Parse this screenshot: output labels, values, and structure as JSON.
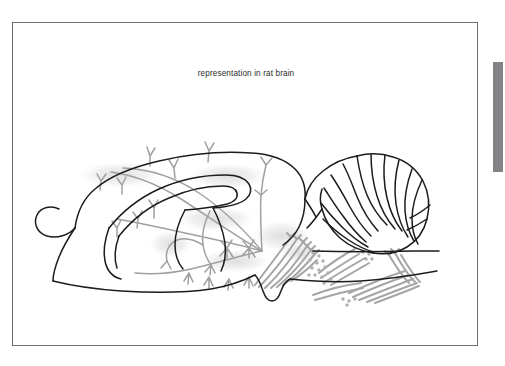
{
  "viewer": {
    "background_color": "#ffffff"
  },
  "figure": {
    "caption": "representation in rat brain",
    "frame": {
      "border_color": "#6d6f72",
      "background_color": "#ffffff",
      "left": 12,
      "top": 22,
      "width": 466,
      "height": 324
    },
    "diagram": {
      "type": "anatomical-line-drawing",
      "subject": "sagittal section of rat brain",
      "outline_color": "#1c1c1c",
      "fiber_color": "#9a9a9a",
      "shading_color": "#e3e3e3",
      "regions": [
        "olfactory bulb",
        "cerebral cortex",
        "corpus callosum",
        "hippocampus",
        "thalamus",
        "hypothalamus",
        "midbrain",
        "cerebellum",
        "brainstem",
        "spinal cord"
      ],
      "annotation_elements": [
        "branching axonal fibers",
        "terminal arbors",
        "bouton clusters",
        "shaded projection fields"
      ]
    }
  },
  "scrollbar": {
    "orientation": "vertical",
    "thumb_color": "#828386",
    "track_color": "#ffffff",
    "thumb_top": 62,
    "thumb_height": 110
  }
}
